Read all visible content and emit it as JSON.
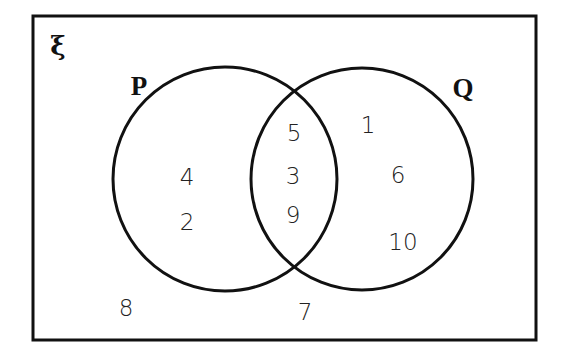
{
  "diagram": {
    "type": "venn",
    "universe": {
      "label": "ξ",
      "outside_elements": [
        {
          "value": "8",
          "x": 126,
          "y": 308
        },
        {
          "value": "7",
          "x": 305,
          "y": 312
        }
      ]
    },
    "sets": [
      {
        "name": "P",
        "label": "P",
        "label_pos": {
          "x": 139,
          "y": 86
        },
        "circle": {
          "cx": 225,
          "cy": 179,
          "r": 112
        },
        "only_elements": [
          {
            "value": "4",
            "x": 187,
            "y": 177
          },
          {
            "value": "2",
            "x": 187,
            "y": 222
          }
        ]
      },
      {
        "name": "Q",
        "label": "Q",
        "label_pos": {
          "x": 463,
          "y": 88
        },
        "circle": {
          "cx": 362,
          "cy": 179,
          "r": 111
        },
        "only_elements": [
          {
            "value": "1",
            "x": 368,
            "y": 125
          },
          {
            "value": "6",
            "x": 398,
            "y": 175
          },
          {
            "value": "10",
            "x": 403,
            "y": 242
          }
        ]
      }
    ],
    "intersection": {
      "sets": [
        "P",
        "Q"
      ],
      "elements": [
        {
          "value": "5",
          "x": 294,
          "y": 133
        },
        {
          "value": "3",
          "x": 293,
          "y": 176
        },
        {
          "value": "9",
          "x": 293,
          "y": 215
        }
      ]
    },
    "border": {
      "x": 33,
      "y": 16,
      "width": 503,
      "height": 324
    },
    "stroke_color": "#111111"
  }
}
